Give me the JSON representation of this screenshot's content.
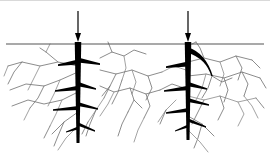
{
  "figure": {
    "name": "root-crack-diagram",
    "caption": "",
    "width": 270,
    "height": 163,
    "background_color": "#ffffff"
  },
  "colors": {
    "ink": "#000000",
    "ground_line": "#555555",
    "crack_line": "#6e6e6e",
    "crack_line_light": "#8a8a8a",
    "top_border": "#d9d9d9",
    "background": "#ffffff"
  },
  "geometry": {
    "ground_line_y": 44,
    "ground_line_x_start": 6,
    "ground_line_x_end": 264,
    "trunk_left_x": 78,
    "trunk_right_x": 188,
    "trunk_top_y": 42,
    "trunk_left_bottom_y": 143,
    "trunk_right_bottom_y": 140,
    "trunk_width_top": 6.5,
    "trunk_width_bottom": 3.0
  },
  "arrows": [
    {
      "name": "load-arrow-left",
      "x": 78,
      "y_start": 11,
      "y_end": 42,
      "shaft_width": 1.2,
      "head_width": 6,
      "head_length": 9,
      "direction": "down"
    },
    {
      "name": "load-arrow-right",
      "x": 188,
      "y_start": 11,
      "y_end": 42,
      "shaft_width": 1.2,
      "head_width": 6,
      "head_length": 9,
      "direction": "down"
    }
  ],
  "trunks": [
    {
      "name": "root-trunk-left",
      "x": 78,
      "top_y": 42,
      "bottom_y": 143,
      "branches": [
        {
          "side": "left",
          "y": 62,
          "length": 20,
          "drop": 3,
          "width": 5.0
        },
        {
          "side": "right",
          "y": 60,
          "length": 22,
          "drop": 4,
          "width": 5.0
        },
        {
          "side": "left",
          "y": 88,
          "length": 23,
          "drop": 3,
          "width": 4.6
        },
        {
          "side": "right",
          "y": 84,
          "length": 18,
          "drop": 5,
          "width": 4.6
        },
        {
          "side": "left",
          "y": 108,
          "length": 25,
          "drop": 2,
          "width": 4.2
        },
        {
          "side": "right",
          "y": 104,
          "length": 20,
          "drop": 5,
          "width": 4.2
        },
        {
          "side": "right",
          "y": 124,
          "length": 17,
          "drop": 7,
          "width": 3.6
        },
        {
          "side": "left",
          "y": 128,
          "length": 12,
          "drop": 4,
          "width": 3.2
        }
      ]
    },
    {
      "name": "root-trunk-right",
      "x": 188,
      "top_y": 42,
      "bottom_y": 140,
      "branches": [
        {
          "side": "left",
          "y": 64,
          "length": 22,
          "drop": 3,
          "width": 5.0
        },
        {
          "side": "left",
          "y": 88,
          "length": 24,
          "drop": 3,
          "width": 4.6
        },
        {
          "side": "right",
          "y": 84,
          "length": 19,
          "drop": 5,
          "width": 4.6
        },
        {
          "side": "left",
          "y": 110,
          "length": 22,
          "drop": 3,
          "width": 4.2
        },
        {
          "side": "right",
          "y": 100,
          "length": 21,
          "drop": 5,
          "width": 4.2
        },
        {
          "side": "right",
          "y": 120,
          "length": 18,
          "drop": 7,
          "width": 3.6
        },
        {
          "side": "left",
          "y": 126,
          "length": 13,
          "drop": 5,
          "width": 3.2
        }
      ],
      "curved_branch": {
        "name": "curved-sweep-branch",
        "start": [
          188,
          50
        ],
        "control": [
          206,
          56
        ],
        "end": [
          212,
          76
        ],
        "width_start": 5.5,
        "width_end": 1.5
      }
    }
  ],
  "crack_network": {
    "name": "soil-crack-network",
    "stroke_width": 0.8,
    "paths": [
      "M78,66 L58,62 L40,66 L22,62 L8,66",
      "M58,62 L46,52 L40,48",
      "M40,66 L34,78 L28,90",
      "M22,62 L14,72 L8,84",
      "M78,72 L60,80 L44,86 L26,84 L10,90",
      "M60,80 L54,94 L48,106",
      "M44,86 L38,98 L30,108",
      "M78,92 L62,100 L44,104 L28,100 L12,106",
      "M62,100 L56,114 L50,126",
      "M78,112 L64,122 L52,134",
      "M64,122 L58,136 L54,146",
      "M78,126 L66,138 L58,150",
      "M100,58 L112,52 L124,56 L134,50 L146,54",
      "M112,52 L108,42",
      "M124,56 L126,68 L122,80",
      "M100,70 L116,74 L132,70 L148,76 L162,72",
      "M116,74 L110,86 L104,98",
      "M132,70 L136,82 L132,94",
      "M148,76 L152,88 L146,100",
      "M100,86 L114,92 L130,88 L146,94 L160,90",
      "M114,92 L108,104 L100,116",
      "M130,88 L134,100 L128,112",
      "M146,94 L150,106 L144,118",
      "M104,98 L96,110 L88,122",
      "M122,80 L118,92 L112,104",
      "M160,90 L172,84 L184,88",
      "M162,72 L174,66 L186,70",
      "M188,62 L204,58 L220,62 L236,56 L252,60",
      "M204,58 L200,48 L196,42",
      "M220,62 L224,74 L220,86",
      "M236,56 L242,68 L238,80",
      "M188,76 L206,74 L224,78 L242,72 L260,78",
      "M206,74 L202,88 L196,100",
      "M224,78 L228,90 L224,102",
      "M242,72 L248,84 L244,96",
      "M188,96 L204,100 L220,96 L238,102 L256,98",
      "M204,100 L198,112 L192,124",
      "M220,96 L224,108 L218,120",
      "M238,102 L244,114 L238,126",
      "M188,116 L202,124 L214,136",
      "M202,124 L198,138 L194,148",
      "M188,130 L200,142 L208,152",
      "M212,76 L222,82 L232,78",
      "M212,76 L208,88 L202,98",
      "M8,66 L4,76",
      "M252,60 L260,68",
      "M260,78 L266,88",
      "M30,108 L24,120",
      "M50,126 L44,138",
      "M88,122 L82,134",
      "M144,118 L138,130 L134,142",
      "M128,112 L122,124 L118,136",
      "M96,110 L90,124 L86,136",
      "M176,100 L166,110 L158,122",
      "M166,110 L160,124",
      "M256,98 L264,108",
      "M244,96 L252,106 L258,118",
      "M110,86 L102,96",
      "M134,100 L142,108",
      "M46,52 L50,44",
      "M196,42 L192,44"
    ]
  }
}
